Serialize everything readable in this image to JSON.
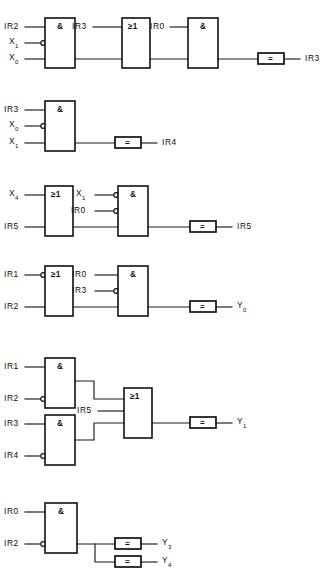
{
  "diagram": {
    "type": "logic-circuit",
    "symbols": {
      "and_gate": "&",
      "or_gate": "≥1",
      "output_box": "="
    },
    "colors": {
      "line": "#1a1a1a",
      "box_stroke": "#111111",
      "background": "#ffffff",
      "text": "#0d0d0d"
    },
    "rows": [
      {
        "id": "row-1",
        "inputs": [
          "IR2",
          "X",
          "X",
          "IR3",
          "IR0"
        ],
        "output": "IR3",
        "gates": [
          "&",
          "≥1",
          "&"
        ],
        "labels": {
          "in_1": "IR2",
          "in_2_base": "X",
          "in_2_sub": "1",
          "in_3_base": "X",
          "in_3_sub": "0",
          "in_4": "IR3",
          "in_5": "IR0",
          "gate_1": "&",
          "gate_2": "≥1",
          "gate_3": "&",
          "eq": "=",
          "out": "IR3"
        }
      },
      {
        "id": "row-2",
        "output": "IR4",
        "labels": {
          "in_1": "IR3",
          "in_2_base": "X",
          "in_2_sub": "0",
          "in_3_base": "X",
          "in_3_sub": "1",
          "gate_1": "&",
          "eq": "=",
          "out": "IR4"
        }
      },
      {
        "id": "row-3",
        "output": "IR5",
        "labels": {
          "in_1_base": "X",
          "in_1_sub": "4",
          "in_2": "IR5",
          "in_3_base": "X",
          "in_3_sub": "1",
          "in_4": "IR0",
          "gate_1": "≥1",
          "gate_2": "&",
          "eq": "=",
          "out": "IR5"
        }
      },
      {
        "id": "row-4",
        "output": "Y0",
        "labels": {
          "in_1": "IR1",
          "in_2": "IR2",
          "in_3": "IR0",
          "in_4": "IR3",
          "gate_1": "≥1",
          "gate_2": "&",
          "eq": "=",
          "out_base": "Y",
          "out_sub": "0"
        }
      },
      {
        "id": "row-5",
        "output": "Y1",
        "labels": {
          "in_1": "IR1",
          "in_2": "IR2",
          "in_3": "IR3",
          "in_4": "IR4",
          "in_5": "IR5",
          "gate_1": "&",
          "gate_2": "&",
          "gate_3": "≥1",
          "eq": "=",
          "out_base": "Y",
          "out_sub": "1"
        }
      },
      {
        "id": "row-6",
        "output": "Y3/Y4",
        "labels": {
          "in_1": "IR0",
          "in_2": "IR2",
          "gate_1": "&",
          "eq_1": "=",
          "eq_2": "=",
          "out_1_base": "Y",
          "out_1_sub": "3",
          "out_2_base": "Y",
          "out_2_sub": "4"
        }
      }
    ]
  }
}
